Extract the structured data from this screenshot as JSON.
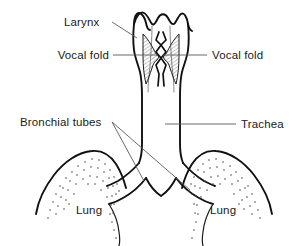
{
  "figure": {
    "background_color": "#ffffff",
    "ink_color": "#111111",
    "leader_color": "#5a5a5a",
    "width": 308,
    "height": 246
  },
  "labels": {
    "larynx": "Larynx",
    "vocal_fold_left": "Vocal fold",
    "vocal_fold_right": "Vocal fold",
    "bronchial_tubes": "Bronchial tubes",
    "trachea": "Trachea",
    "lung_left": "Lung",
    "lung_right": "Lung"
  },
  "structures": [
    {
      "name": "larynx",
      "label": "Larynx",
      "description": "scalloped funnel at top of airway"
    },
    {
      "name": "vocal-fold-left",
      "label": "Vocal fold",
      "description": "hatched wedge left of glottis"
    },
    {
      "name": "vocal-fold-right",
      "label": "Vocal fold",
      "description": "hatched wedge right of glottis"
    },
    {
      "name": "trachea",
      "label": "Trachea",
      "description": "vertical windpipe below larynx"
    },
    {
      "name": "bronchial-tubes",
      "label": "Bronchial tubes",
      "description": "paired branches entering lungs"
    },
    {
      "name": "lung-left",
      "label": "Lung",
      "description": "stippled dome, viewer left"
    },
    {
      "name": "lung-right",
      "label": "Lung",
      "description": "stippled dome, viewer right"
    }
  ]
}
